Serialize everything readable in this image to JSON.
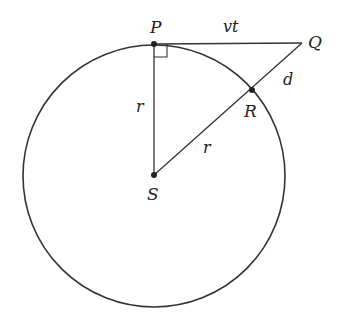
{
  "diagram": {
    "colors": {
      "stroke": "#333333",
      "background": "#ffffff"
    },
    "circle": {
      "cx": 154,
      "cy": 176,
      "r": 131
    },
    "points": {
      "P": {
        "label": "P",
        "x": 154,
        "y": 44
      },
      "Q": {
        "label": "Q",
        "x": 302,
        "y": 43
      },
      "R": {
        "label": "R",
        "x": 252,
        "y": 90
      },
      "S": {
        "label": "S",
        "x": 154,
        "y": 175
      }
    },
    "segments": {
      "PQ": {
        "label": "vt"
      },
      "QR": {
        "label": "d"
      },
      "PS": {
        "label": "r"
      },
      "SR": {
        "label": "r"
      }
    },
    "right_angle_at": "P"
  }
}
